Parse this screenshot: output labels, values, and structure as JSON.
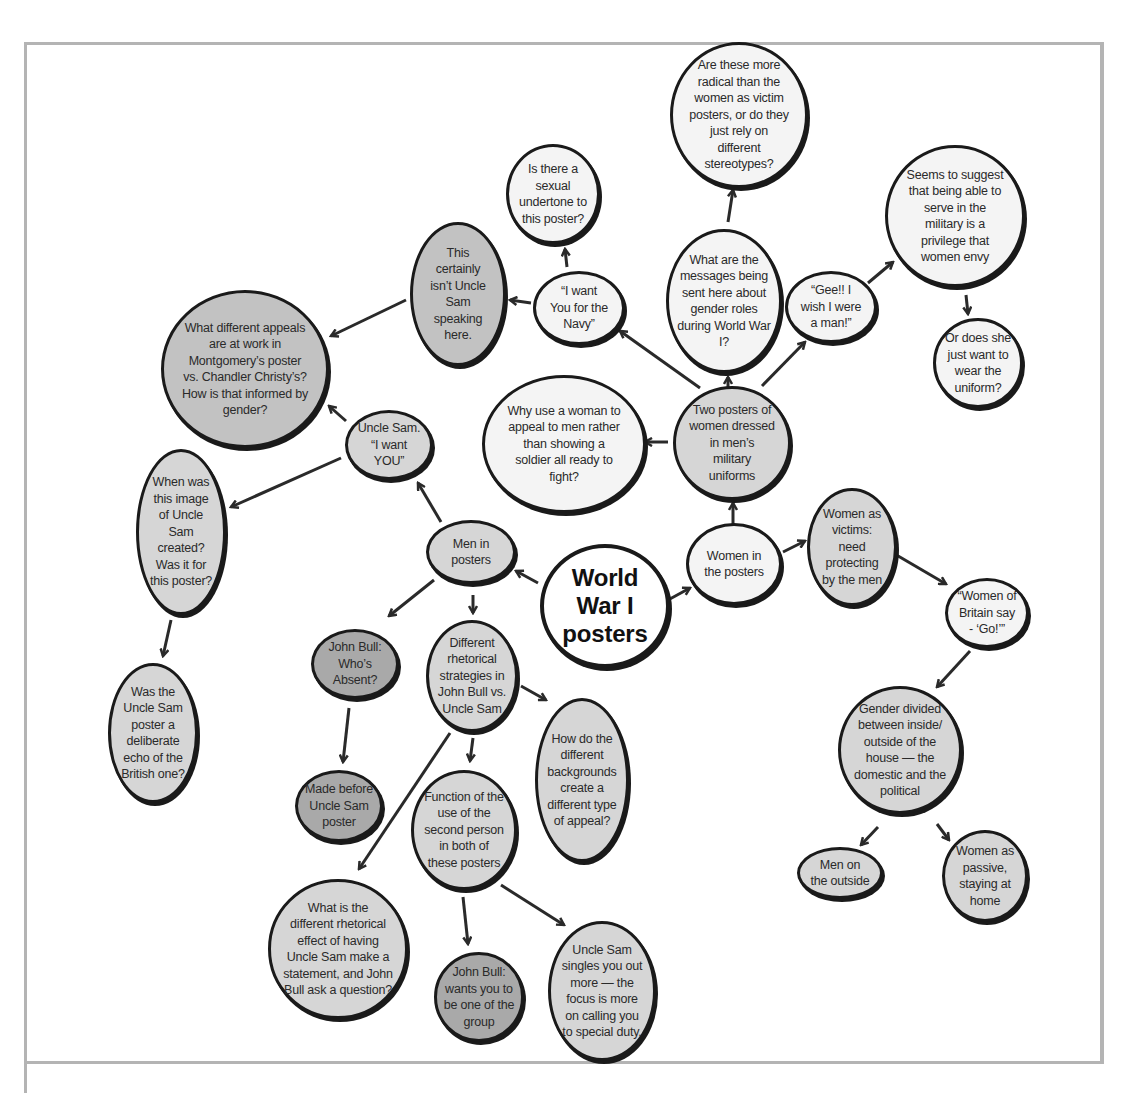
{
  "diagram": {
    "type": "concept-map",
    "colors": {
      "frame": "#b4b4b4",
      "node_border": "#1a1a1a",
      "fill_white": "#f4f4f4",
      "fill_light": "#d6d6d6",
      "fill_medium": "#c2c2c2",
      "fill_dark": "#a9a9a9",
      "arrow": "#2a2a2a"
    },
    "central": {
      "label": "World\nWar I\nposters"
    },
    "nodes": {
      "women_in_posters": "Women in\nthe posters",
      "two_posters": "Two posters of\nwomen dressed\nin men’s\nmilitary\nuniforms",
      "why_woman": "Why use a woman to\nappeal to men rather\nthan showing a\nsoldier all ready to\nfight?",
      "messages": "What are the\nmessages being\nsent here about\ngender roles\nduring World War\nI?",
      "more_radical": "Are these more\nradical than the\nwomen as victim\nposters, or do they\njust rely on\ndifferent\nstereotypes?",
      "gee": "“Gee!! I\nwish I were\na man!”",
      "privilege": "Seems to suggest\nthat being able to\nserve in the\nmilitary is a\nprivilege that\nwomen envy",
      "uniform": "Or does she\njust want to\nwear the\nuniform?",
      "navy": "“I want\nYou for the\nNavy”",
      "sexual": "Is there a\nsexual\nundertone to\nthis poster?",
      "not_uncle_sam": "This\ncertainly\nisn’t Uncle\nSam\nspeaking\nhere.",
      "different_appeals": "What different appeals\nare at work in\nMontgomery’s poster\nvs. Chandler Christy’s?\nHow is that informed by\ngender?",
      "victims": "Women as\nvictims:\nneed\nprotecting\nby the men",
      "women_britain": "“Women of\nBritain say\n- ‘Go!’”",
      "gender_divided": "Gender divided\nbetween inside/\noutside of the\nhouse — the\ndomestic and the\npolitical",
      "men_outside": "Men on\nthe outside",
      "women_passive": "Women as\npassive,\nstaying at\nhome",
      "men_in_posters": "Men in\nposters",
      "uncle_sam_want": "Uncle Sam.\n“I want\nYOU”",
      "when_created": "When was\nthis image\nof Uncle\nSam\ncreated?\nWas it for\nthis poster?",
      "deliberate_echo": "Was the\nUncle Sam\nposter a\ndeliberate\necho of the\nBritish one?",
      "john_bull_absent": "John Bull:\nWho’s\nAbsent?",
      "made_before": "Made before\nUncle Sam\nposter",
      "rhetorical_strategies": "Different\nrhetorical\nstrategies in\nJohn Bull vs.\nUncle Sam",
      "backgrounds": "How do the\ndifferent\nbackgrounds\ncreate a\ndifferent type\nof appeal?",
      "second_person": "Function of the\nuse of the\nsecond person\nin both of\nthese posters",
      "rhetorical_effect": "What is the\ndifferent rhetorical\neffect of having\nUncle Sam make a\nstatement, and John\nBull ask a question?",
      "one_of_group": "John Bull:\nwants you to\nbe one of the\ngroup",
      "singles_out": "Uncle Sam\nsingles you out\nmore — the\nfocus is more\non calling you\nto special duty."
    },
    "edges": [
      [
        "central",
        "women_in_posters"
      ],
      [
        "central",
        "men_in_posters"
      ],
      [
        "women_in_posters",
        "two_posters"
      ],
      [
        "women_in_posters",
        "victims"
      ],
      [
        "two_posters",
        "why_woman"
      ],
      [
        "two_posters",
        "messages"
      ],
      [
        "two_posters",
        "navy"
      ],
      [
        "two_posters",
        "gee"
      ],
      [
        "messages",
        "more_radical"
      ],
      [
        "gee",
        "privilege"
      ],
      [
        "privilege",
        "uniform"
      ],
      [
        "navy",
        "sexual"
      ],
      [
        "navy",
        "not_uncle_sam"
      ],
      [
        "not_uncle_sam",
        "different_appeals"
      ],
      [
        "victims",
        "women_britain"
      ],
      [
        "women_britain",
        "gender_divided"
      ],
      [
        "gender_divided",
        "men_outside"
      ],
      [
        "gender_divided",
        "women_passive"
      ],
      [
        "men_in_posters",
        "uncle_sam_want"
      ],
      [
        "men_in_posters",
        "john_bull_absent"
      ],
      [
        "men_in_posters",
        "rhetorical_strategies"
      ],
      [
        "uncle_sam_want",
        "different_appeals"
      ],
      [
        "uncle_sam_want",
        "when_created"
      ],
      [
        "when_created",
        "deliberate_echo"
      ],
      [
        "john_bull_absent",
        "made_before"
      ],
      [
        "rhetorical_strategies",
        "backgrounds"
      ],
      [
        "rhetorical_strategies",
        "second_person"
      ],
      [
        "rhetorical_strategies",
        "rhetorical_effect"
      ],
      [
        "second_person",
        "one_of_group"
      ],
      [
        "second_person",
        "singles_out"
      ]
    ]
  }
}
